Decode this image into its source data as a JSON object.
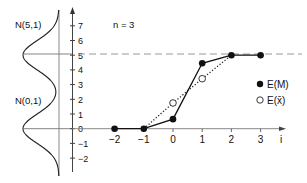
{
  "chart_data": {
    "type": "line",
    "title": "",
    "annotation": "n = 3",
    "xlabel": "i",
    "ylabel": "",
    "x": [
      -2,
      -1,
      0,
      1,
      2,
      3
    ],
    "x_ticks": [
      "-2",
      "-1",
      "0",
      "1",
      "2",
      "3"
    ],
    "y_ticks": [
      "7",
      "6",
      "5",
      "4",
      "3",
      "2",
      "1",
      "0",
      "-1",
      "-2"
    ],
    "xlim": [
      -2.5,
      3.8
    ],
    "ylim": [
      -2.5,
      7.8
    ],
    "grid": false,
    "legend_position": "right",
    "series": [
      {
        "name": "E(M)",
        "marker": "filled-circle",
        "line": "solid",
        "x": [
          -2,
          -1,
          0,
          1,
          2,
          3
        ],
        "values": [
          0,
          0,
          0.65,
          4.45,
          5,
          5
        ]
      },
      {
        "name": "E(x̄)",
        "marker": "open-circle",
        "line": "dotted",
        "x": [
          -1,
          0,
          1,
          2
        ],
        "values": [
          0,
          1.75,
          3.4,
          5
        ]
      }
    ],
    "reference_line": {
      "y": 5,
      "style": "dashed"
    },
    "side_distributions": [
      {
        "label": "N(5,1)",
        "mean": 5,
        "sd": 1
      },
      {
        "label": "N(0,1)",
        "mean": 0,
        "sd": 1
      }
    ]
  },
  "legend": {
    "em": "E(M)",
    "ex": "E(x̄)"
  },
  "labels": {
    "n": "n = 3",
    "n51": "N(5,1)",
    "n01": "N(0,1)",
    "i": "i"
  }
}
